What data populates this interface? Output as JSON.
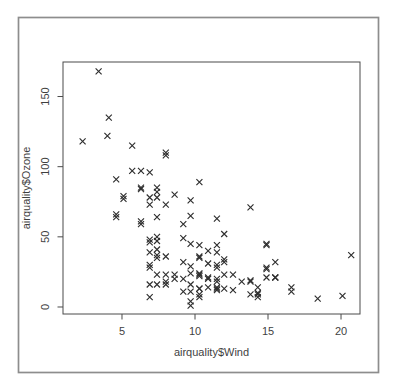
{
  "window": {
    "background": "#ffffff",
    "border_color": "#8d8d8d"
  },
  "chart_data": {
    "type": "scatter",
    "title": "",
    "xlabel": "airquality$Wind",
    "ylabel": "airquality$Ozone",
    "x_ticks": [
      5,
      10,
      15,
      20
    ],
    "y_ticks": [
      0,
      50,
      100,
      150
    ],
    "xlim": [
      0.96,
      21.3
    ],
    "ylim": [
      -5.0,
      174.6
    ],
    "grid": false,
    "legend": false,
    "marker": "x",
    "marker_color": "#2f2f2f",
    "axis_color": "#4a4a4a",
    "label_color": "#3f3f3f",
    "series": [
      {
        "name": "airquality",
        "points": [
          [
            7.4,
            41
          ],
          [
            8.0,
            36
          ],
          [
            12.6,
            12
          ],
          [
            11.5,
            18
          ],
          [
            14.9,
            28
          ],
          [
            8.6,
            23
          ],
          [
            13.8,
            19
          ],
          [
            20.1,
            8
          ],
          [
            6.9,
            7
          ],
          [
            9.7,
            16
          ],
          [
            9.2,
            11
          ],
          [
            10.9,
            14
          ],
          [
            13.2,
            18
          ],
          [
            11.5,
            14
          ],
          [
            12.0,
            34
          ],
          [
            18.4,
            6
          ],
          [
            11.5,
            30
          ],
          [
            9.7,
            11
          ],
          [
            9.7,
            1
          ],
          [
            16.6,
            11
          ],
          [
            9.7,
            4
          ],
          [
            12.0,
            32
          ],
          [
            12.0,
            23
          ],
          [
            14.9,
            45
          ],
          [
            5.7,
            115
          ],
          [
            7.4,
            37
          ],
          [
            9.7,
            29
          ],
          [
            13.8,
            71
          ],
          [
            11.5,
            39
          ],
          [
            8.0,
            23
          ],
          [
            14.9,
            21
          ],
          [
            20.7,
            37
          ],
          [
            9.2,
            20
          ],
          [
            11.5,
            12
          ],
          [
            10.3,
            13
          ],
          [
            4.1,
            135
          ],
          [
            9.2,
            49
          ],
          [
            9.2,
            32
          ],
          [
            4.6,
            64
          ],
          [
            10.9,
            40
          ],
          [
            5.1,
            77
          ],
          [
            6.3,
            97
          ],
          [
            5.7,
            97
          ],
          [
            7.4,
            85
          ],
          [
            14.3,
            10
          ],
          [
            14.9,
            27
          ],
          [
            14.3,
            7
          ],
          [
            6.9,
            48
          ],
          [
            10.3,
            35
          ],
          [
            6.3,
            61
          ],
          [
            5.1,
            79
          ],
          [
            11.5,
            63
          ],
          [
            6.9,
            16
          ],
          [
            8.6,
            80
          ],
          [
            8.0,
            108
          ],
          [
            8.6,
            20
          ],
          [
            12.0,
            52
          ],
          [
            7.4,
            82
          ],
          [
            7.4,
            50
          ],
          [
            7.4,
            64
          ],
          [
            9.2,
            59
          ],
          [
            6.9,
            39
          ],
          [
            13.8,
            9
          ],
          [
            7.4,
            16
          ],
          [
            6.9,
            78
          ],
          [
            7.4,
            35
          ],
          [
            4.6,
            66
          ],
          [
            4.0,
            122
          ],
          [
            10.3,
            89
          ],
          [
            8.0,
            110
          ],
          [
            11.5,
            44
          ],
          [
            11.5,
            28
          ],
          [
            9.7,
            65
          ],
          [
            10.3,
            22
          ],
          [
            6.3,
            59
          ],
          [
            7.4,
            23
          ],
          [
            10.9,
            31
          ],
          [
            10.3,
            44
          ],
          [
            15.5,
            21
          ],
          [
            14.3,
            9
          ],
          [
            9.7,
            45
          ],
          [
            3.4,
            168
          ],
          [
            8.0,
            73
          ],
          [
            9.7,
            76
          ],
          [
            2.3,
            118
          ],
          [
            6.3,
            84
          ],
          [
            6.3,
            85
          ],
          [
            6.9,
            96
          ],
          [
            7.4,
            78
          ],
          [
            6.9,
            73
          ],
          [
            4.6,
            91
          ],
          [
            7.4,
            47
          ],
          [
            15.5,
            32
          ],
          [
            10.9,
            20
          ],
          [
            10.3,
            23
          ],
          [
            10.9,
            21
          ],
          [
            9.7,
            24
          ],
          [
            14.9,
            44
          ],
          [
            15.5,
            21
          ],
          [
            6.9,
            28
          ],
          [
            10.3,
            9
          ],
          [
            11.5,
            13
          ],
          [
            6.9,
            46
          ],
          [
            13.8,
            18
          ],
          [
            10.3,
            13
          ],
          [
            10.3,
            24
          ],
          [
            8.0,
            16
          ],
          [
            12.0,
            13
          ],
          [
            12.6,
            23
          ],
          [
            10.3,
            36
          ],
          [
            10.3,
            7
          ],
          [
            16.6,
            14
          ],
          [
            6.9,
            30
          ],
          [
            14.3,
            14
          ],
          [
            8.0,
            18
          ],
          [
            11.5,
            20
          ]
        ]
      }
    ]
  }
}
